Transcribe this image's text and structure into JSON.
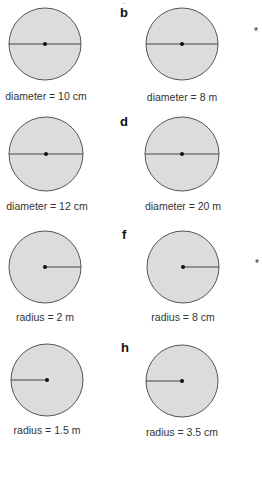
{
  "page": {
    "top_fragment": "ˎ",
    "markers": [
      "*",
      "*"
    ]
  },
  "items": [
    {
      "letter": "",
      "kind": "diameter",
      "label": "diameter = 10 cm",
      "cx": 45,
      "cy": 44
    },
    {
      "letter": "b",
      "kind": "diameter",
      "label": "diameter = 8 m",
      "cx": 182,
      "cy": 44
    },
    {
      "letter": "",
      "kind": "diameter",
      "label": "diameter = 12 cm",
      "cx": 46,
      "cy": 154
    },
    {
      "letter": "d",
      "kind": "diameter",
      "label": "diameter = 20 m",
      "cx": 182,
      "cy": 154
    },
    {
      "letter": "",
      "kind": "radius-right",
      "label": "radius = 2 m",
      "cx": 45,
      "cy": 267
    },
    {
      "letter": "f",
      "kind": "radius-right",
      "label": "radius = 8 cm",
      "cx": 183,
      "cy": 267
    },
    {
      "letter": "",
      "kind": "radius-left",
      "label": "radius = 1.5 m",
      "cx": 47,
      "cy": 380
    },
    {
      "letter": "h",
      "kind": "radius-left",
      "label": "radius = 3.5 cm",
      "cx": 182,
      "cy": 381
    }
  ],
  "colors": {
    "circle_fill": "#dcdcdc",
    "circle_stroke": "#555555",
    "line": "#444444"
  }
}
